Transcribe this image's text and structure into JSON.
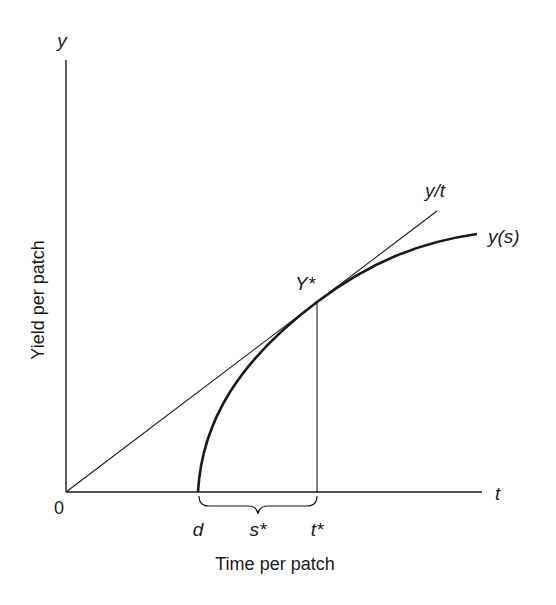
{
  "figure": {
    "y_axis_symbol": "y",
    "x_axis_symbol": "t",
    "origin_label": "0",
    "y_axis_title": "Yield per patch",
    "x_axis_title": "Time per patch",
    "curve_label": "y(s)",
    "line_label": "y/t",
    "tangent_point_label": "Y*",
    "tick_labels": {
      "d": "d",
      "s_star": "s*",
      "t_star": "t*"
    }
  },
  "colors": {
    "ink": "#1a1a1a",
    "background": "#ffffff"
  }
}
